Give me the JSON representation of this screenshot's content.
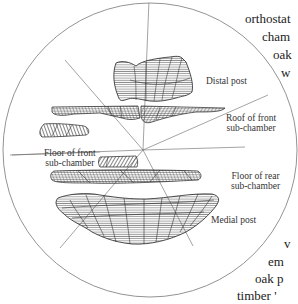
{
  "figure": {
    "labels": {
      "distal_post": "Distal post",
      "roof_front_line1": "Roof of front",
      "roof_front_line2": "sub-chamber",
      "floor_front_line1": "Floor of front",
      "floor_front_line2": "sub-chamber",
      "floor_rear_line1": "Floor of rear",
      "floor_rear_line2": "sub-chamber",
      "medial_post": "Medial post"
    },
    "colors": {
      "line": "#555555",
      "hatch": "#333333",
      "background": "#ffffff"
    }
  },
  "body_text": {
    "top": [
      "orthostat",
      "cham",
      "oak",
      "w"
    ],
    "bottom": [
      "v",
      "em",
      "oak p",
      "timber '"
    ]
  }
}
